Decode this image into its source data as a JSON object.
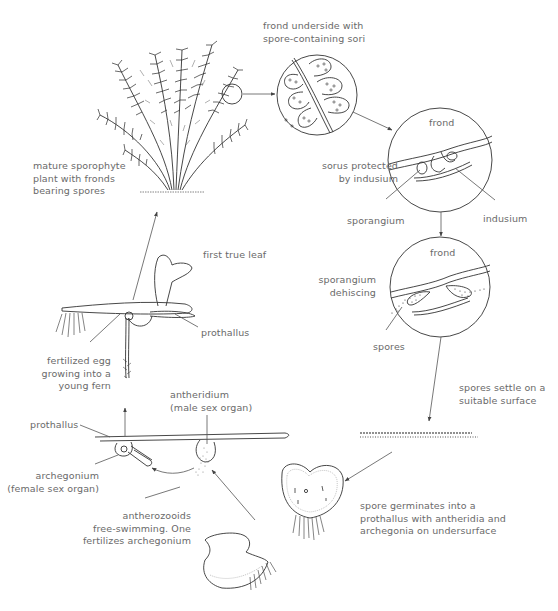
{
  "diagram": {
    "stages": [
      {
        "id": "sporophyte",
        "label_lines": [
          "mature sporophyte",
          "plant with fronds",
          "bearing spores"
        ]
      },
      {
        "id": "frond-underside",
        "label_lines": [
          "frond underside with",
          "spore-containing sori"
        ]
      },
      {
        "id": "sorus",
        "inset_label": "frond",
        "label_lines": [
          "sorus protected",
          "by indusium"
        ],
        "parts": [
          "sporangium",
          "indusium"
        ]
      },
      {
        "id": "dehiscing",
        "inset_label": "frond",
        "label_lines": [
          "sporangium",
          "dehiscing"
        ],
        "parts": [
          "spores"
        ]
      },
      {
        "id": "spores-settle",
        "label_lines": [
          "spores settle on a",
          "suitable surface"
        ]
      },
      {
        "id": "germination",
        "label_lines": [
          "spore germinates into a",
          "prothallus with antheridia and",
          "archegonia on undersurface"
        ]
      },
      {
        "id": "fertilization",
        "labels": {
          "prothallus": "prothallus",
          "antheridium": [
            "antheridium",
            "(male sex organ)"
          ],
          "archegonium": [
            "archegonium",
            "(female sex organ)"
          ],
          "antherozooids": [
            "antherozooids",
            "free-swimming. One",
            "fertilizes archegonium"
          ]
        }
      },
      {
        "id": "young-fern",
        "labels": {
          "first_leaf": "first true leaf",
          "prothallus": "prothallus",
          "fertilized_egg": [
            "fertilized egg",
            "growing into a",
            "young fern"
          ]
        }
      }
    ],
    "colors": {
      "text": "#6a6a6a",
      "line": "#555555",
      "drawing": "#333333",
      "background": "#ffffff"
    }
  }
}
